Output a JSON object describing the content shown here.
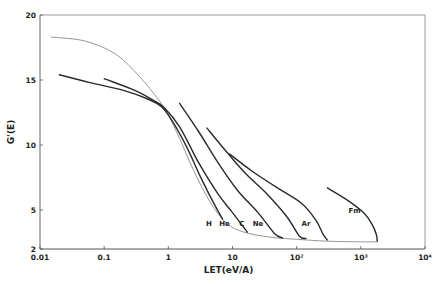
{
  "chart_data": {
    "type": "line",
    "title": "",
    "xlabel": "LET(eV/A)",
    "ylabel": "G'(E)",
    "xscale": "log",
    "xlim": [
      0.01,
      10000
    ],
    "ylim": [
      2,
      20
    ],
    "grid": false,
    "x_ticks": [
      {
        "value": 0.01,
        "label": "0.01"
      },
      {
        "value": 0.1,
        "label": "0.1"
      },
      {
        "value": 1,
        "label": "1"
      },
      {
        "value": 10,
        "label": "10"
      },
      {
        "value": 100,
        "label": "10²"
      },
      {
        "value": 1000,
        "label": "10³"
      },
      {
        "value": 10000,
        "label": "10⁴"
      }
    ],
    "y_ticks": [
      {
        "value": 2,
        "label": "2"
      },
      {
        "value": 5,
        "label": "5"
      },
      {
        "value": 10,
        "label": "10"
      },
      {
        "value": 15,
        "label": "15"
      },
      {
        "value": 20,
        "label": "20"
      }
    ],
    "series": [
      {
        "name": "reference",
        "label": "",
        "style": "thin-gray",
        "points": [
          [
            0.015,
            18.3
          ],
          [
            0.05,
            18.0
          ],
          [
            0.15,
            17.0
          ],
          [
            0.35,
            15.3
          ],
          [
            0.7,
            13.5
          ],
          [
            1.0,
            12.3
          ],
          [
            1.5,
            10.5
          ],
          [
            2.5,
            8.0
          ],
          [
            4.5,
            5.6
          ],
          [
            8,
            4.0
          ],
          [
            15,
            3.3
          ],
          [
            40,
            2.9
          ],
          [
            100,
            2.75
          ],
          [
            300,
            2.6
          ],
          [
            1000,
            2.55
          ],
          [
            1800,
            2.55
          ]
        ]
      },
      {
        "name": "H",
        "label": "H",
        "style": "thick",
        "points": [
          [
            0.02,
            15.4
          ],
          [
            0.06,
            14.8
          ],
          [
            0.2,
            14.2
          ],
          [
            0.5,
            13.5
          ],
          [
            0.8,
            12.9
          ],
          [
            1.2,
            11.7
          ],
          [
            2,
            9.7
          ],
          [
            3,
            7.8
          ],
          [
            5,
            5.6
          ],
          [
            7,
            4.3
          ]
        ]
      },
      {
        "name": "He",
        "label": "He",
        "style": "thick",
        "points": [
          [
            0.1,
            15.1
          ],
          [
            0.3,
            14.2
          ],
          [
            0.6,
            13.4
          ],
          [
            0.85,
            12.9
          ],
          [
            1.5,
            11.4
          ],
          [
            3,
            8.6
          ],
          [
            6,
            6.2
          ],
          [
            10,
            4.8
          ],
          [
            17,
            3.3
          ]
        ]
      },
      {
        "name": "C",
        "label": "C",
        "style": "thick",
        "points": [
          [
            1.5,
            13.2
          ],
          [
            3,
            11.0
          ],
          [
            6,
            8.6
          ],
          [
            12,
            6.5
          ],
          [
            25,
            4.8
          ],
          [
            45,
            3.2
          ],
          [
            60,
            2.85
          ]
        ]
      },
      {
        "name": "Ne",
        "label": "Ne",
        "style": "thick",
        "points": [
          [
            4,
            11.3
          ],
          [
            8,
            9.5
          ],
          [
            16,
            7.8
          ],
          [
            35,
            6.2
          ],
          [
            70,
            4.5
          ],
          [
            110,
            3.0
          ],
          [
            140,
            2.8
          ]
        ]
      },
      {
        "name": "Ar",
        "label": "Ar",
        "style": "thick",
        "points": [
          [
            9,
            9.3
          ],
          [
            20,
            8.0
          ],
          [
            50,
            6.7
          ],
          [
            120,
            5.5
          ],
          [
            200,
            4.2
          ],
          [
            260,
            3.1
          ],
          [
            300,
            2.7
          ]
        ]
      },
      {
        "name": "Fm",
        "label": "Fm",
        "style": "thick",
        "points": [
          [
            300,
            6.7
          ],
          [
            600,
            5.8
          ],
          [
            1100,
            4.8
          ],
          [
            1500,
            3.9
          ],
          [
            1750,
            3.1
          ],
          [
            1800,
            2.6
          ]
        ]
      }
    ],
    "annotations": [
      {
        "text": "H",
        "x": 4.3,
        "y": 3.8
      },
      {
        "text": "He",
        "x": 7.5,
        "y": 3.8
      },
      {
        "text": "C",
        "x": 14,
        "y": 3.8
      },
      {
        "text": "Ne",
        "x": 25,
        "y": 3.8
      },
      {
        "text": "Ar",
        "x": 140,
        "y": 3.8
      },
      {
        "text": "Fm",
        "x": 800,
        "y": 4.8
      }
    ]
  }
}
